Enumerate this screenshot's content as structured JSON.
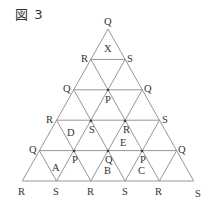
{
  "title": "図 3",
  "geometry": {
    "apex": [
      108,
      29
    ],
    "dx": 34.3,
    "dy": 30.4,
    "rows": 5
  },
  "vertex_labels": [
    {
      "label": "Q",
      "x": 108,
      "y": 29,
      "dx": -4,
      "dy": -4
    },
    {
      "label": "R",
      "x": 91,
      "y": 60,
      "dx": -10,
      "dy": 2
    },
    {
      "label": "S",
      "x": 125,
      "y": 60,
      "dx": 2,
      "dy": 2
    },
    {
      "label": "Q",
      "x": 74,
      "y": 90,
      "dx": -11,
      "dy": 2
    },
    {
      "label": "P",
      "x": 108,
      "y": 90,
      "dx": -3,
      "dy": 13
    },
    {
      "label": "Q",
      "x": 142,
      "y": 90,
      "dx": 2,
      "dy": 2
    },
    {
      "label": "R",
      "x": 56,
      "y": 121,
      "dx": -10,
      "dy": 2
    },
    {
      "label": "S",
      "x": 91,
      "y": 121,
      "dx": -2,
      "dy": 12
    },
    {
      "label": "R",
      "x": 125,
      "y": 121,
      "dx": -2,
      "dy": 12
    },
    {
      "label": "S",
      "x": 159,
      "y": 121,
      "dx": 3,
      "dy": 2
    },
    {
      "label": "Q",
      "x": 39,
      "y": 151,
      "dx": -10,
      "dy": 2
    },
    {
      "label": "P",
      "x": 74,
      "y": 151,
      "dx": -2,
      "dy": 12
    },
    {
      "label": "Q",
      "x": 108,
      "y": 151,
      "dx": -3,
      "dy": 12
    },
    {
      "label": "P",
      "x": 142,
      "y": 151,
      "dx": -2,
      "dy": 12
    },
    {
      "label": "Q",
      "x": 176,
      "y": 151,
      "dx": 2,
      "dy": 2
    },
    {
      "label": "R",
      "x": 22,
      "y": 181,
      "dx": -4,
      "dy": 14
    },
    {
      "label": "S",
      "x": 56,
      "y": 181,
      "dx": -3,
      "dy": 14
    },
    {
      "label": "R",
      "x": 91,
      "y": 181,
      "dx": -4,
      "dy": 14
    },
    {
      "label": "S",
      "x": 125,
      "y": 181,
      "dx": -3,
      "dy": 14
    },
    {
      "label": "R",
      "x": 159,
      "y": 181,
      "dx": -4,
      "dy": 14
    },
    {
      "label": "S",
      "x": 193,
      "y": 181,
      "dx": 2,
      "dy": 16
    }
  ],
  "region_labels": [
    {
      "label": "X",
      "x": 104,
      "y": 52
    },
    {
      "label": "D",
      "x": 67,
      "y": 136
    },
    {
      "label": "E",
      "x": 120,
      "y": 146
    },
    {
      "label": "A",
      "x": 52,
      "y": 171
    },
    {
      "label": "B",
      "x": 104,
      "y": 174
    },
    {
      "label": "C",
      "x": 138,
      "y": 174
    }
  ],
  "nodes_dotted": [
    [
      108,
      90
    ],
    [
      91,
      121
    ],
    [
      125,
      121
    ],
    [
      74,
      151
    ],
    [
      108,
      151
    ],
    [
      142,
      151
    ]
  ]
}
